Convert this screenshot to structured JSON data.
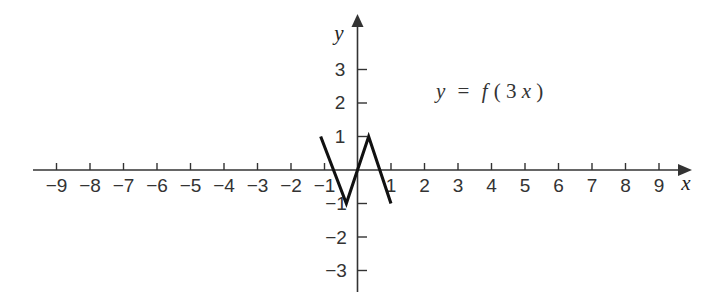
{
  "chart_data": {
    "type": "line",
    "title": "",
    "subtitle": "",
    "xlabel": "x",
    "ylabel": "y",
    "xlim": [
      -9.8,
      9.8
    ],
    "ylim": [
      -3.6,
      3.6
    ],
    "grid": false,
    "legend": null,
    "annotations": [
      {
        "text_plain": "y = f(3x)",
        "x": 2.5,
        "y": 2.1
      }
    ],
    "equation": {
      "lhs": "y",
      "equals": "=",
      "rhs_fn": "f",
      "rhs_open": "(",
      "rhs_coeff": "3",
      "rhs_var": "x",
      "rhs_close": ")",
      "full": "y = f(3x)"
    },
    "xticks": [
      -9,
      -8,
      -7,
      -6,
      -5,
      -4,
      -3,
      -2,
      -1,
      1,
      2,
      3,
      4,
      5,
      6,
      7,
      8,
      9
    ],
    "xticklabels": [
      "−9",
      "−8",
      "−7",
      "−6",
      "−5",
      "−4",
      "−3",
      "−2",
      "−1",
      "1",
      "2",
      "3",
      "4",
      "5",
      "6",
      "7",
      "8",
      "9"
    ],
    "yticks": [
      3,
      2,
      1,
      -1,
      -2,
      -3
    ],
    "yticklabels": [
      "3",
      "2",
      "1",
      "−1",
      "−2",
      "−3"
    ],
    "series": [
      {
        "name": "y = f(3x)",
        "color": "#111111",
        "x": [
          -1.1,
          -0.3333,
          0.3333,
          1.0
        ],
        "y": [
          1.0,
          -1.0,
          1.0,
          -1.0
        ]
      }
    ]
  },
  "axes": {
    "x_axis_label": "x",
    "y_axis_label": "y",
    "x_arrow": "arrow-right",
    "y_arrow": "arrow-up"
  }
}
